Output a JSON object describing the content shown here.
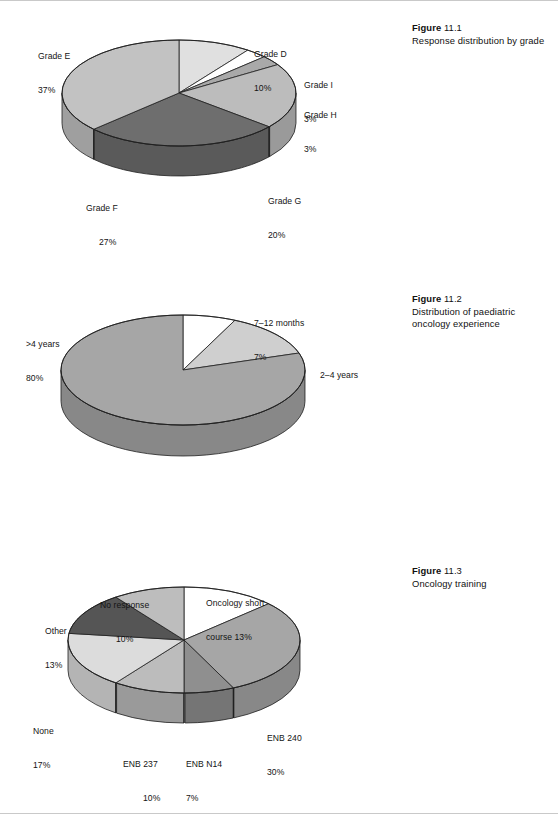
{
  "page": {
    "background": "#ffffff",
    "width": 558,
    "height": 814
  },
  "palette": {
    "slice_white": "#ffffff",
    "slice_lightest": "#e0e0e0",
    "slice_light": "#cfcfcf",
    "slice_midlight": "#bcbcbc",
    "slice_mid": "#a9a9a9",
    "slice_middark": "#8f8f8f",
    "slice_dark": "#6e6e6e",
    "slice_darkest": "#555555",
    "outline": "#1f1f1f",
    "label_text": "#141414",
    "caption_text": "#111111"
  },
  "figures": [
    {
      "id": "figure-11-1",
      "caption": {
        "label": "Figure",
        "number": "11.1",
        "body": "Response distribution by grade"
      },
      "chart_data": {
        "type": "pie",
        "title": "Response distribution by grade",
        "three_d": true,
        "start_angle_deg": -90,
        "direction": "clockwise",
        "categories": [
          "Grade D",
          "Grade I",
          "Grade H",
          "Grade G",
          "Grade F",
          "Grade E"
        ],
        "values": [
          10,
          3,
          3,
          20,
          27,
          37
        ],
        "unit": "%",
        "colors": [
          "#e0e0e0",
          "#ffffff",
          "#a9a9a9",
          "#bcbcbc",
          "#6e6e6e",
          "#c2c2c2"
        ],
        "labels": [
          {
            "name": "Grade D",
            "value": "10%",
            "text_line1": "Grade D",
            "text_line2": "10%"
          },
          {
            "name": "Grade I",
            "value": "3%",
            "text_line1": "Grade I",
            "text_line2": "3%"
          },
          {
            "name": "Grade H",
            "value": "3%",
            "text_line1": "Grade H",
            "text_line2": "3%"
          },
          {
            "name": "Grade G",
            "value": "20%",
            "text_line1": "Grade G",
            "text_line2": "20%"
          },
          {
            "name": "Grade F",
            "value": "27%",
            "text_line1": "Grade F",
            "text_line2": "27%"
          },
          {
            "name": "Grade E",
            "value": "37%",
            "text_line1": "Grade E",
            "text_line2": "37%"
          }
        ]
      }
    },
    {
      "id": "figure-11-2",
      "caption": {
        "label": "Figure",
        "number": "11.2",
        "body": "Distribution of paediatric oncology experience"
      },
      "chart_data": {
        "type": "pie",
        "title": "Distribution of paediatric oncology experience",
        "three_d": true,
        "start_angle_deg": -90,
        "direction": "clockwise",
        "categories": [
          "7–12 months",
          "2–4 years",
          ">4 years"
        ],
        "values": [
          7,
          13,
          80
        ],
        "unit": "%",
        "colors": [
          "#ffffff",
          "#cfcfcf",
          "#a6a6a6"
        ],
        "labels": [
          {
            "name": "7–12 months",
            "value": "7%",
            "text_line1": "7–12 months",
            "text_line2": "7%"
          },
          {
            "name": "2–4 years",
            "value": "",
            "text_line1": "2–4 years",
            "text_line2": ""
          },
          {
            "name": ">4 years",
            "value": "80%",
            "text_line1": ">4 years",
            "text_line2": "80%"
          }
        ]
      }
    },
    {
      "id": "figure-11-3",
      "caption": {
        "label": "Figure",
        "number": "11.3",
        "body": "Oncology training"
      },
      "chart_data": {
        "type": "pie",
        "title": "Oncology training",
        "three_d": true,
        "start_angle_deg": -90,
        "direction": "clockwise",
        "categories": [
          "Oncology short course",
          "ENB 240",
          "ENB N14",
          "ENB 237",
          "None",
          "Other",
          "No response"
        ],
        "values": [
          13,
          30,
          7,
          10,
          17,
          13,
          10
        ],
        "unit": "%",
        "colors": [
          "#ffffff",
          "#a6a6a6",
          "#8f8f8f",
          "#bcbcbc",
          "#dcdcdc",
          "#555555",
          "#bdbdbd"
        ],
        "labels": [
          {
            "name": "Oncology short course",
            "value": "13%",
            "text_line1": "Oncology short",
            "text_line2": "course 13%"
          },
          {
            "name": "ENB 240",
            "value": "30%",
            "text_line1": "ENB 240",
            "text_line2": "30%"
          },
          {
            "name": "ENB N14",
            "value": "7%",
            "text_line1": "ENB N14",
            "text_line2": "7%"
          },
          {
            "name": "ENB 237",
            "value": "10%",
            "text_line1": "ENB 237",
            "text_line2": "10%"
          },
          {
            "name": "None",
            "value": "17%",
            "text_line1": "None",
            "text_line2": "17%"
          },
          {
            "name": "Other",
            "value": "13%",
            "text_line1": "Other",
            "text_line2": "13%"
          },
          {
            "name": "No response",
            "value": "10%",
            "text_line1": "No response",
            "text_line2": "10%"
          }
        ]
      }
    }
  ]
}
